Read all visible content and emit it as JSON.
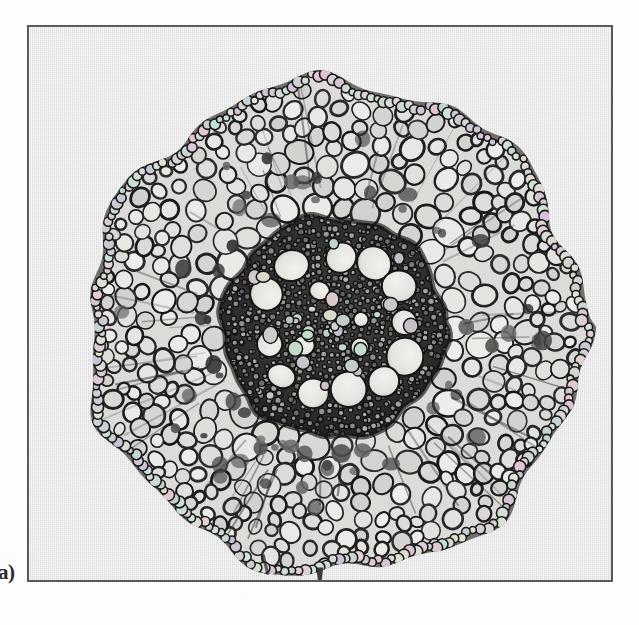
{
  "figure": {
    "panel_label": "a)",
    "caption": "",
    "specimen_type": "monocot root transverse section",
    "image_kind": "black-and-white light micrograph",
    "frame": {
      "border_color": "#5a5a5a",
      "border_width_px": 2,
      "background_color": "#e9e9e9",
      "x": 27,
      "y": 25,
      "width": 586,
      "height": 557
    },
    "colors": {
      "page_background": "#fdfdfd",
      "film_background": "#e9e9e9",
      "cell_wall_dark": "#1e1e1e",
      "cell_lumen_light": "#ededea",
      "stele_dark": "#262626",
      "stained_cell": "#4a4a4a",
      "label_text": "#2b2b2b"
    },
    "structures": [
      {
        "name": "epidermis",
        "description": "dark irregular outer cell layer bounding the section"
      },
      {
        "name": "cortex",
        "description": "broad zone of large rounded parenchyma cells with dark walls"
      },
      {
        "name": "endodermis",
        "description": "dark ring marking the outer edge of the stele"
      },
      {
        "name": "stele",
        "description": "dense dark central cylinder of small cells"
      },
      {
        "name": "metaxylem-vessels",
        "description": "large pale circular vessel lumina arranged in a ring within the stele"
      },
      {
        "name": "pith",
        "description": "small cells filling the centre of the stele"
      },
      {
        "name": "root-hair",
        "description": "small protrusion at the lower margin of the section"
      }
    ],
    "geometry": {
      "section_center_x": 307,
      "section_center_y": 300,
      "section_radius_x": 249,
      "section_radius_y": 246,
      "stele_center_x": 305,
      "stele_center_y": 300,
      "stele_radius": 112,
      "metaxylem_count": 12,
      "cortex_cell_count": 900
    }
  }
}
